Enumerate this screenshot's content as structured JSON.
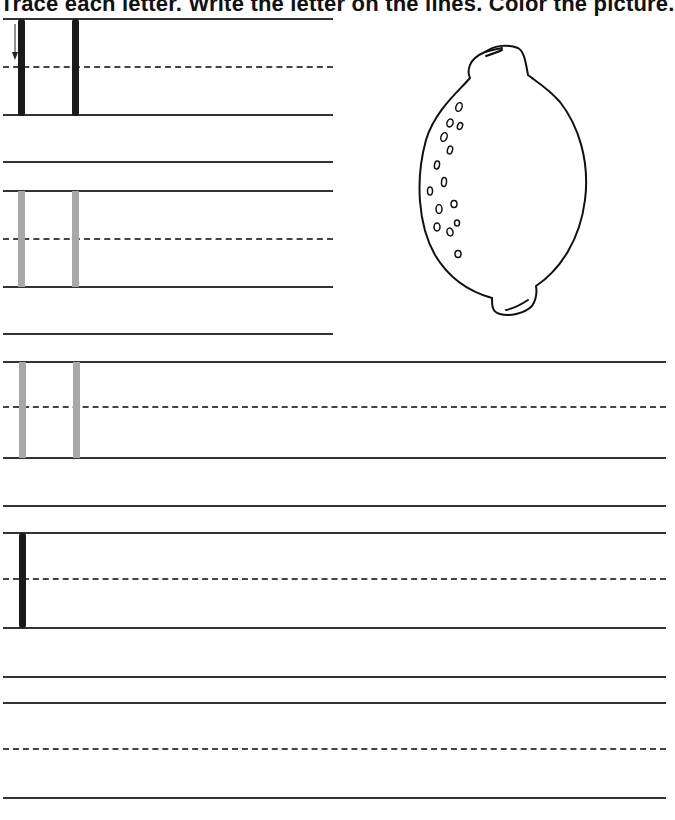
{
  "worksheet": {
    "title": "Trace each letter. Write the letter on the lines. Color the picture.",
    "letter": "l",
    "picture": "lemon",
    "colors": {
      "rule_line": "#333333",
      "dashed_midline": "#444444",
      "trace_dark": "#1a1a1a",
      "trace_light": "#a8a8a8",
      "picture_outline": "#111111"
    },
    "rows": [
      {
        "id": 1,
        "type": "trace-dark",
        "letters": 2,
        "has_stroke_arrow": true,
        "width": "half"
      },
      {
        "id": 2,
        "type": "trace-light",
        "letters": 2,
        "width": "half"
      },
      {
        "id": 3,
        "type": "trace-light",
        "letters": 2,
        "width": "full"
      },
      {
        "id": 4,
        "type": "model-letter",
        "letters": 1,
        "width": "full"
      },
      {
        "id": 5,
        "type": "blank",
        "letters": 0,
        "width": "full"
      }
    ]
  }
}
